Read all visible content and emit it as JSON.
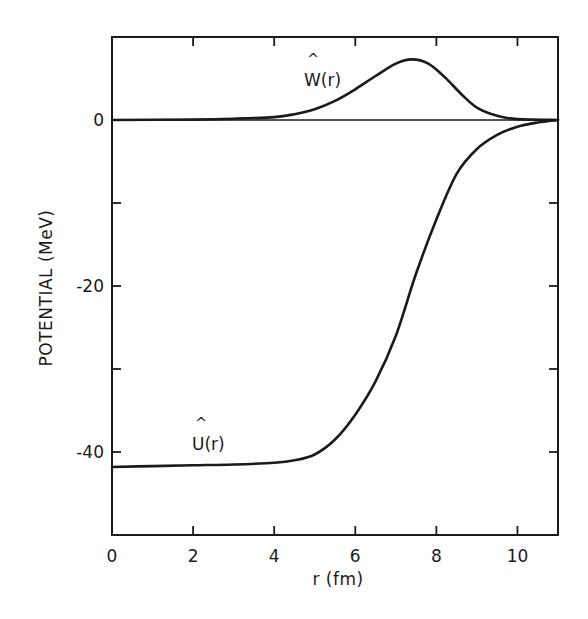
{
  "chart_data": {
    "type": "line",
    "title": "",
    "xlabel": "r (fm)",
    "ylabel": "POTENTIAL (MeV)",
    "xlim": [
      0,
      11
    ],
    "ylim": [
      -50,
      10
    ],
    "x_ticks": [
      0,
      2,
      4,
      6,
      8,
      10
    ],
    "x_tick_labels": [
      "0",
      "2",
      "4",
      "6",
      "8",
      "10"
    ],
    "y_ticks": [
      10,
      0,
      -10,
      -20,
      -30,
      -40,
      -50
    ],
    "y_tick_labels": [
      "0",
      "-20",
      "-40"
    ],
    "y_labeled_ticks": [
      0,
      -20,
      -40
    ],
    "grid": false,
    "legend": null,
    "zero_line": true,
    "series": [
      {
        "name": "Û(r)",
        "label": "U(r)",
        "x": [
          0,
          1,
          2,
          3,
          4,
          4.5,
          5,
          5.5,
          6,
          6.5,
          7,
          7.5,
          8,
          8.5,
          9,
          9.5,
          10,
          10.5,
          11
        ],
        "y": [
          -41.8,
          -41.7,
          -41.6,
          -41.5,
          -41.3,
          -41.0,
          -40.3,
          -38.5,
          -35.5,
          -31.5,
          -26.0,
          -18.5,
          -12.0,
          -6.5,
          -3.5,
          -1.8,
          -0.8,
          -0.3,
          0
        ]
      },
      {
        "name": "Ŵ(r)",
        "label": "W(r)",
        "x": [
          0,
          2,
          3,
          4,
          4.5,
          5,
          5.5,
          6,
          6.5,
          7,
          7.4,
          7.8,
          8.2,
          8.6,
          9,
          9.5,
          10,
          11
        ],
        "y": [
          0,
          0.05,
          0.15,
          0.35,
          0.7,
          1.3,
          2.3,
          3.7,
          5.3,
          6.8,
          7.3,
          6.8,
          5.2,
          3.2,
          1.5,
          0.5,
          0.1,
          0
        ]
      }
    ],
    "annotations": [
      {
        "text": "W(r)",
        "hat": true,
        "x": 5.3,
        "y": 4.5
      },
      {
        "text": "U(r)",
        "hat": true,
        "x": 2.0,
        "y": -39.0
      }
    ]
  },
  "labels": {
    "ylabel": "POTENTIAL  (MeV)",
    "xlabel": "r (fm)",
    "w_label": "W(r)",
    "u_label": "U(r)",
    "hat": "^"
  }
}
